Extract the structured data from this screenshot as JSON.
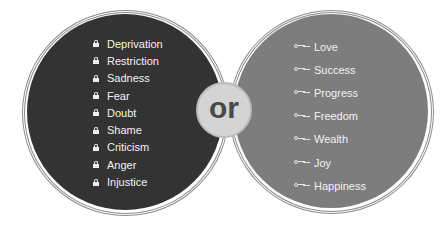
{
  "left_circle": {
    "icon": "lock-icon",
    "fill": "#333333",
    "items": [
      "Deprivation",
      "Restriction",
      "Sadness",
      "Fear",
      "Doubt",
      "Shame",
      "Criticism",
      "Anger",
      "Injustice"
    ]
  },
  "center": {
    "label": "or"
  },
  "right_circle": {
    "icon": "key-icon",
    "fill": "#7d7d7d",
    "items": [
      "Love",
      "Success",
      "Progress",
      "Freedom",
      "Wealth",
      "Joy",
      "Happiness"
    ]
  }
}
